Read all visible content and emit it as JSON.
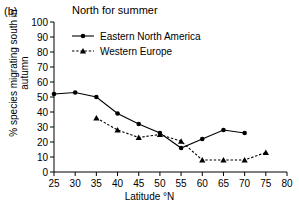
{
  "panel": {
    "label": "(b)"
  },
  "chart_data": {
    "type": "line",
    "title": "North for summer",
    "xlabel": "Latitude °N",
    "ylabel": "% species migrating south in\nautumn",
    "xlim": [
      25,
      80
    ],
    "ylim": [
      0,
      100
    ],
    "xticks": [
      25,
      30,
      35,
      40,
      45,
      50,
      55,
      60,
      65,
      70,
      75,
      80
    ],
    "yticks": [
      0,
      10,
      20,
      30,
      40,
      50,
      60,
      70,
      80,
      90,
      100
    ],
    "grid": false,
    "legend_position": "upper-left-inside",
    "series": [
      {
        "name": "Eastern North America",
        "marker": "circle",
        "linestyle": "solid",
        "color": "#000000",
        "x": [
          25,
          30,
          35,
          40,
          45,
          50,
          55,
          60,
          65,
          70
        ],
        "values": [
          52,
          53,
          50,
          39,
          32,
          26,
          16,
          22,
          28,
          26
        ]
      },
      {
        "name": "Western Europe",
        "marker": "triangle",
        "linestyle": "dashed",
        "color": "#000000",
        "x": [
          35,
          40,
          45,
          50,
          55,
          60,
          65,
          70,
          75
        ],
        "values": [
          36,
          28,
          23,
          25,
          20.5,
          8,
          8,
          8,
          13
        ]
      }
    ]
  },
  "legend": {
    "items": [
      {
        "label": "Eastern North America"
      },
      {
        "label": "Western Europe"
      }
    ]
  }
}
